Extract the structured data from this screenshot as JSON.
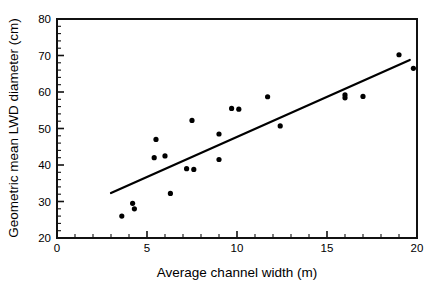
{
  "chart_data": {
    "type": "scatter",
    "title": "",
    "xlabel": "Average channel width (m)",
    "ylabel": "Geometric mean LWD diameter (cm)",
    "xlim": [
      0,
      20
    ],
    "ylim": [
      20,
      80
    ],
    "xticks": [
      0,
      5,
      10,
      15,
      20
    ],
    "xtick_labels": [
      "0",
      "5",
      "10",
      "15",
      "20"
    ],
    "yticks": [
      20,
      30,
      40,
      50,
      60,
      70,
      80
    ],
    "ytick_labels": [
      "20",
      "30",
      "40",
      "50",
      "60",
      "70",
      "80"
    ],
    "x_minor_tick_step": 1,
    "y_minor_tick_step": 2,
    "grid": false,
    "legend": false,
    "marker": "filled-circle",
    "marker_color": "#000000",
    "points": [
      {
        "x": 3.6,
        "y": 26.0
      },
      {
        "x": 4.2,
        "y": 29.5
      },
      {
        "x": 4.3,
        "y": 28.0
      },
      {
        "x": 5.4,
        "y": 42.0
      },
      {
        "x": 5.5,
        "y": 47.0
      },
      {
        "x": 6.0,
        "y": 42.5
      },
      {
        "x": 6.3,
        "y": 32.2
      },
      {
        "x": 7.2,
        "y": 39.0
      },
      {
        "x": 7.5,
        "y": 52.2
      },
      {
        "x": 7.6,
        "y": 38.8
      },
      {
        "x": 9.0,
        "y": 48.5
      },
      {
        "x": 9.0,
        "y": 41.5
      },
      {
        "x": 9.7,
        "y": 55.5
      },
      {
        "x": 10.1,
        "y": 55.3
      },
      {
        "x": 11.7,
        "y": 58.7
      },
      {
        "x": 12.4,
        "y": 50.7
      },
      {
        "x": 16.0,
        "y": 59.2
      },
      {
        "x": 16.0,
        "y": 58.4
      },
      {
        "x": 17.0,
        "y": 58.8
      },
      {
        "x": 19.0,
        "y": 70.2
      },
      {
        "x": 19.8,
        "y": 66.5
      }
    ],
    "fit_line": {
      "type": "linear-regression",
      "x_start": 3.0,
      "y_start": 32.3,
      "x_end": 19.6,
      "y_end": 68.8
    }
  }
}
